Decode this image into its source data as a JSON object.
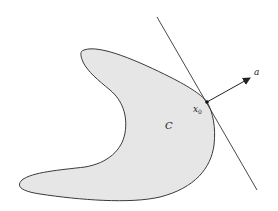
{
  "diagram": {
    "set_label": "C",
    "point_label": "x",
    "point_subscript": "0",
    "vector_label": "a",
    "colors": {
      "set_fill": "#e6e6e6",
      "outline": "#3a3a3a",
      "line": "#333333",
      "background": "#ffffff"
    }
  }
}
